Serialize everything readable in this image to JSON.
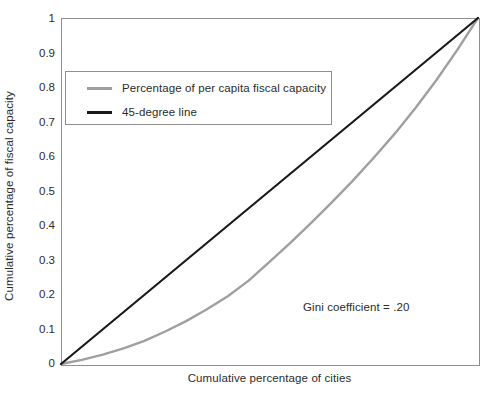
{
  "chart_data": {
    "type": "line",
    "title": "",
    "xlabel": "Cumulative percentage of cities",
    "ylabel": "Cumulative percentage of fiscal capacity",
    "xlim": [
      0,
      1
    ],
    "ylim": [
      0,
      1
    ],
    "grid": false,
    "legend_position": "upper-left-inside",
    "x_ticklabels": [],
    "y_ticklabels": [
      "1",
      "0.9",
      "0.8",
      "0.7",
      "0.6",
      "0.5",
      "0.4",
      "0.3",
      "0.2",
      "0.1",
      "0"
    ],
    "y_tickvalues": [
      1,
      0.9,
      0.8,
      0.7,
      0.6,
      0.5,
      0.4,
      0.3,
      0.2,
      0.1,
      0
    ],
    "annotations": [
      {
        "text": "Gini coefficient = .20",
        "x": 0.58,
        "y": 0.18
      }
    ],
    "series": [
      {
        "name": "Percentage of per capita fiscal capacity",
        "color": "#9f9f9f",
        "width": 2.4,
        "x": [
          0,
          0.05,
          0.1,
          0.15,
          0.2,
          0.25,
          0.3,
          0.35,
          0.4,
          0.45,
          0.5,
          0.55,
          0.6,
          0.65,
          0.7,
          0.75,
          0.8,
          0.85,
          0.9,
          0.95,
          1.0
        ],
        "values": [
          0,
          0.012,
          0.027,
          0.045,
          0.067,
          0.094,
          0.124,
          0.158,
          0.196,
          0.241,
          0.295,
          0.35,
          0.408,
          0.468,
          0.53,
          0.596,
          0.665,
          0.74,
          0.82,
          0.907,
          1.0
        ]
      },
      {
        "name": "45-degree line",
        "color": "#1a1a1a",
        "width": 2.2,
        "x": [
          0,
          1
        ],
        "values": [
          0,
          1
        ]
      }
    ]
  },
  "axes": {
    "y_title": "Cumulative percentage of fiscal capacity",
    "x_title": "Cumulative percentage of cities",
    "frame_color": "#8e8e8e"
  },
  "legend": {
    "items": [
      {
        "label": "Percentage of per capita fiscal capacity",
        "swatch": "gray-line-swatch"
      },
      {
        "label": "45-degree line",
        "swatch": "black-line-swatch"
      }
    ]
  },
  "annotation": {
    "gini_text": "Gini coefficient = .20"
  },
  "yticks": {
    "t0": "1",
    "t1": "0.9",
    "t2": "0.8",
    "t3": "0.7",
    "t4": "0.6",
    "t5": "0.5",
    "t6": "0.4",
    "t7": "0.3",
    "t8": "0.2",
    "t9": "0.1",
    "t10": "0"
  }
}
